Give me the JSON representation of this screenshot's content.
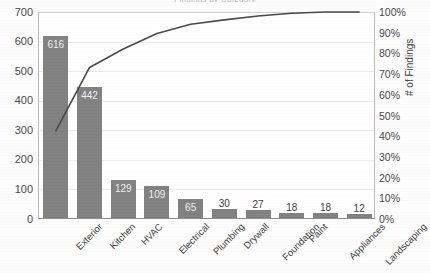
{
  "chart_data": {
    "type": "bar",
    "title": "Findings by Category",
    "xlabel": "",
    "ylabel": "# of Findings",
    "y2label": "# of Findings",
    "categories": [
      "Exterior",
      "Kitchen",
      "HVAC",
      "Electrical",
      "Plumbing",
      "Drywall",
      "Foundation",
      "Paint",
      "Appliances",
      "Landscaping"
    ],
    "values": [
      616,
      442,
      129,
      109,
      65,
      30,
      27,
      18,
      18,
      12
    ],
    "value_labels": [
      "616",
      "442",
      "129",
      "109",
      "65",
      "30",
      "27",
      "18",
      "18",
      "12"
    ],
    "cumulative_percent": [
      42.6,
      73.2,
      82.1,
      89.6,
      94.1,
      96.2,
      98.1,
      99.4,
      100.0,
      100.0
    ],
    "series": [
      {
        "name": "# of Findings",
        "type": "bar",
        "values": [
          616,
          442,
          129,
          109,
          65,
          30,
          27,
          18,
          18,
          12
        ]
      },
      {
        "name": "Cumulative %",
        "type": "line",
        "values": [
          42.6,
          73.2,
          82.1,
          89.6,
          94.1,
          96.2,
          98.1,
          99.4,
          100.0,
          100.0
        ]
      }
    ],
    "ylim": [
      0,
      700
    ],
    "y2lim": [
      0,
      100
    ],
    "yticks": [
      "0",
      "100",
      "200",
      "300",
      "400",
      "500",
      "600",
      "700"
    ],
    "y2ticks": [
      "0%",
      "10%",
      "20%",
      "30%",
      "40%",
      "50%",
      "60%",
      "70%",
      "80%",
      "90%",
      "100%"
    ],
    "grid": true,
    "legend": "none",
    "bar_color": "#828282",
    "line_color": "#4a4a4a",
    "total": 1446
  }
}
